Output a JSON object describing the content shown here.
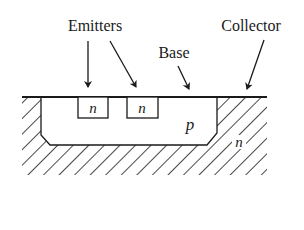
{
  "diagram": {
    "type": "transistor-cross-section",
    "labels": {
      "emitters": "Emitters",
      "base": "Base",
      "collector": "Collector"
    },
    "regions": {
      "emitter_1": "n",
      "emitter_2": "n",
      "base_region": "p",
      "collector_region": "n"
    },
    "colors": {
      "ink": "#1a1a1a",
      "background": "#ffffff"
    }
  }
}
